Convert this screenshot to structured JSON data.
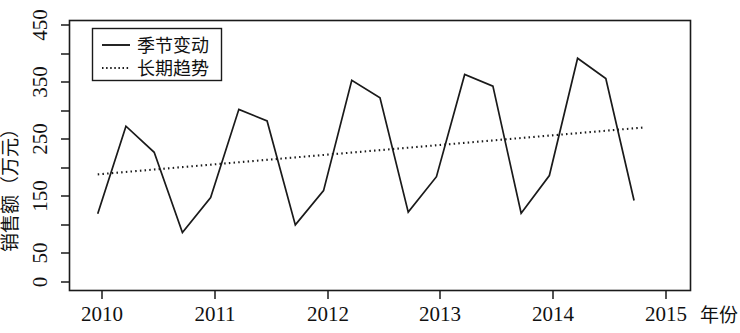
{
  "chart_data": {
    "type": "line",
    "title": "",
    "xlabel": "年份",
    "ylabel": "销售额（万元）",
    "xlim": [
      2009.75,
      2015.25
    ],
    "ylim": [
      0,
      465
    ],
    "grid": false,
    "legend_position": "top-left",
    "xticks": [
      "2010",
      "2011",
      "2012",
      "2013",
      "2014",
      "2015"
    ],
    "xtick_values": [
      2010,
      2011,
      2012,
      2013,
      2014,
      2015
    ],
    "yticks": [
      "0",
      "50",
      "150",
      "250",
      "350",
      "450"
    ],
    "ytick_values": [
      0,
      50,
      150,
      250,
      350,
      450
    ],
    "yminor_values": [
      100,
      200,
      300,
      400
    ],
    "x": [
      2010.0,
      2010.25,
      2010.5,
      2010.75,
      2011.0,
      2011.25,
      2011.5,
      2011.75,
      2012.0,
      2012.25,
      2012.5,
      2012.75,
      2013.0,
      2013.25,
      2013.5,
      2013.75,
      2014.0,
      2014.25,
      2014.5,
      2014.75
    ],
    "series": [
      {
        "name": "季节变动",
        "style": "solid",
        "values": [
          132,
          283,
          238,
          100,
          160,
          312,
          292,
          113,
          172,
          362,
          332,
          135,
          196,
          372,
          352,
          133,
          198,
          400,
          365,
          155
        ]
      },
      {
        "name": "长期趋势",
        "style": "dotted",
        "values": [
          200,
          204,
          208,
          212,
          216,
          221,
          225,
          229,
          233,
          237,
          241,
          245,
          249,
          253,
          257,
          261,
          265,
          269,
          273,
          277
        ]
      }
    ],
    "trend_endpoints": {
      "start_x": 2010.0,
      "start_y": 200,
      "end_x": 2014.85,
      "end_y": 281
    }
  },
  "legend": {
    "items": [
      {
        "label": "季节变动",
        "style": "solid"
      },
      {
        "label": "长期趋势",
        "style": "dotted"
      }
    ]
  },
  "axes": {
    "y_title": "销售额（万元）",
    "x_title": "年份"
  }
}
